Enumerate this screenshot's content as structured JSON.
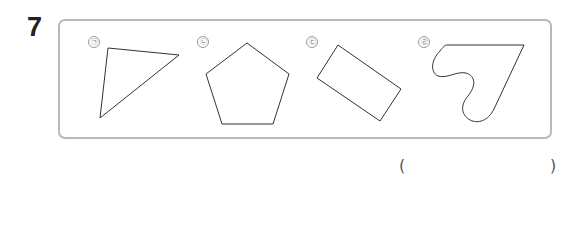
{
  "question": {
    "number": "7"
  },
  "figures": [
    {
      "label": "㉠",
      "shape": "triangle"
    },
    {
      "label": "㉡",
      "shape": "pentagon"
    },
    {
      "label": "㉢",
      "shape": "rectangle"
    },
    {
      "label": "㉣",
      "shape": "curved-shape"
    }
  ],
  "answer": {
    "open_paren": "(",
    "close_paren": ")",
    "value": ""
  },
  "colors": {
    "stroke": "#333333",
    "box_border": "#b9b9b9"
  }
}
